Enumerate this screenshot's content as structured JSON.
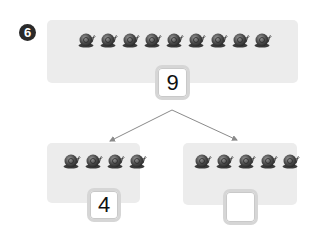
{
  "problem": {
    "number": "6",
    "whole": {
      "snail_count": 9,
      "value": "9"
    },
    "parts": [
      {
        "snail_count": 4,
        "value": "4"
      },
      {
        "snail_count": 5,
        "value": ""
      }
    ]
  },
  "icons": {
    "item": "snail-icon",
    "connector": "arrow-icon"
  },
  "colors": {
    "panel": "#ececec",
    "badge": "#2a2a2a",
    "box_border": "#d6d6d6",
    "arrow": "#8a8a8a",
    "snail": "#4a4a4a"
  }
}
